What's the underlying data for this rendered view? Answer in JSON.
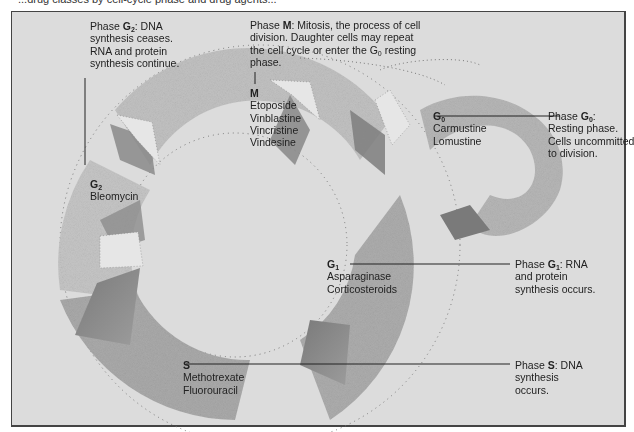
{
  "caption_cut": "...drug classes by cell-cycle phase and drug agents...",
  "phases": {
    "g2": {
      "desc_prefix": "Phase ",
      "letter": "G",
      "sub": "2",
      "desc_rest": ": DNA",
      "desc_lines": [
        "synthesis ceases.",
        "RNA and protein",
        "synthesis continue."
      ],
      "label_letter": "G",
      "label_sub": "2",
      "drugs": [
        "Bleomycin"
      ]
    },
    "m": {
      "desc_prefix": "Phase ",
      "letter": "M",
      "desc_rest": ": Mitosis, the process of cell",
      "desc_lines": [
        "division. Daughter cells may repeat"
      ],
      "desc_line3_pre": "the cell cycle or enter the G",
      "desc_line3_sub": "0",
      "desc_line3_post": " resting",
      "desc_line4": "phase.",
      "label": "M",
      "drugs": [
        "Etoposide",
        "Vinblastine",
        "Vincristine",
        "Vindesine"
      ]
    },
    "g0": {
      "label_letter": "G",
      "label_sub": "0",
      "drugs": [
        "Carmustine",
        "Lomustine"
      ],
      "desc_prefix": "Phase ",
      "letter": "G",
      "sub": "0",
      "desc_rest": ":",
      "desc_lines": [
        "Resting phase.",
        "Cells uncommitted",
        "to division."
      ]
    },
    "g1": {
      "label_letter": "G",
      "label_sub": "1",
      "drugs": [
        "Asparaginase",
        "Corticosteroids"
      ],
      "desc_prefix": "Phase ",
      "letter": "G",
      "sub": "1",
      "desc_rest": ": RNA",
      "desc_lines": [
        "and protein",
        "synthesis occurs."
      ]
    },
    "s": {
      "label": "S",
      "drugs": [
        "Methotrexate",
        "Fluorouracil"
      ],
      "desc_prefix": "Phase ",
      "letter": "S",
      "desc_rest": ": DNA",
      "desc_lines": [
        "synthesis",
        "occurs."
      ]
    }
  },
  "colors": {
    "background": "#dcdcdc",
    "frame_border": "#444444",
    "stipple_dark": "#6a6a6a",
    "text": "#222222"
  }
}
